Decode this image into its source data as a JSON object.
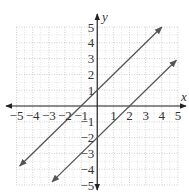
{
  "chart_data": {
    "type": "line",
    "title": "",
    "xlabel": "x",
    "ylabel": "y",
    "xlim": [
      -5,
      5
    ],
    "ylim": [
      -5,
      5
    ],
    "grid": true,
    "x_ticks": [
      -5,
      -4,
      -3,
      -2,
      -1,
      1,
      2,
      3,
      4,
      5
    ],
    "y_ticks": [
      5,
      4,
      3,
      2,
      1,
      -1,
      -2,
      -3,
      -4,
      -5
    ],
    "series": [
      {
        "name": "y = x + 1",
        "slope": 1,
        "intercept": 1,
        "x": [
          -4.8,
          4
        ],
        "y": [
          -3.8,
          5
        ],
        "arrows": "both"
      },
      {
        "name": "y = x - 2",
        "slope": 1,
        "intercept": -2,
        "x": [
          -2.8,
          4.9
        ],
        "y": [
          -4.8,
          2.9
        ],
        "arrows": "both"
      }
    ],
    "colors": {
      "lines": "#555555",
      "axes": "#222222",
      "grid": "#bbbbbb"
    }
  },
  "labels": {
    "x_axis": "x",
    "y_axis": "y",
    "x_ticks": [
      "−5",
      "−4",
      "−3",
      "−2",
      "−1",
      "1",
      "2",
      "3",
      "4",
      "5"
    ],
    "y_ticks": [
      "5",
      "4",
      "3",
      "2",
      "1",
      "−1",
      "−2",
      "−3",
      "−4",
      "−5"
    ]
  }
}
